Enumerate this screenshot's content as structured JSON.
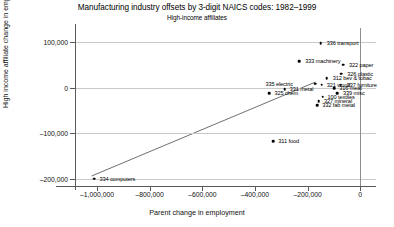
{
  "chart_data": {
    "type": "scatter",
    "title": "Manufacturing industry offsets by 3-digit NAICS codes: 1982–1999",
    "subtitle": "High-income affiliates",
    "xlabel": "Parent change in employment",
    "ylabel": "High income affiliate change in employment",
    "xlim": [
      -1080000,
      60000
    ],
    "ylim": [
      -215000,
      130000
    ],
    "xticks": [
      -1000000,
      -800000,
      -600000,
      -400000,
      -200000,
      0
    ],
    "xticklabels": [
      "–1,000,000",
      "–800,000",
      "–600,000",
      "–400,000",
      "–200,000",
      "0"
    ],
    "yticks": [
      100000,
      0,
      -100000,
      -200000
    ],
    "yticklabels": [
      "100,000",
      "0",
      "–100,000",
      "–200,000"
    ],
    "grid": true,
    "legend": "none",
    "marker_color": "#000000",
    "fit_line": {
      "x0": -1020000,
      "y0": -193000,
      "x1": -170000,
      "y1": 12000,
      "color": "#4a4a4a"
    },
    "points": [
      {
        "label": "336 transport",
        "x": -150000,
        "y": 97000,
        "lx": 6,
        "ly": 0
      },
      {
        "label": "333 machinery",
        "x": -232000,
        "y": 58000,
        "lx": 6,
        "ly": 0
      },
      {
        "label": "322 paper",
        "x": -65000,
        "y": 50000,
        "lx": 6,
        "ly": 0
      },
      {
        "label": "326 plastic",
        "x": -72000,
        "y": 30000,
        "lx": 6,
        "ly": 0
      },
      {
        "label": "312 bev & tobac",
        "x": -127000,
        "y": 21000,
        "lx": 6,
        "ly": 0
      },
      {
        "label": "337 furniture",
        "x": -74000,
        "y": 6000,
        "lx": 6,
        "ly": 0
      },
      {
        "label": "335 electric",
        "x": -170000,
        "y": 8000,
        "lx": -50,
        "ly": 0
      },
      {
        "label": "321 wood",
        "x": -146000,
        "y": 6000,
        "lx": 5,
        "ly": 0
      },
      {
        "label": "316 meat",
        "x": -99000,
        "y": -2000,
        "lx": 5,
        "ly": 0
      },
      {
        "label": "339 misc",
        "x": -88000,
        "y": -12000,
        "lx": 6,
        "ly": 0
      },
      {
        "label": "331 metal",
        "x": -287000,
        "y": -4000,
        "lx": 5,
        "ly": 0
      },
      {
        "label": "325 chem",
        "x": -345000,
        "y": -12000,
        "lx": 5,
        "ly": 0
      },
      {
        "label": "100 textiles",
        "x": -143000,
        "y": -20000,
        "lx": 5,
        "ly": 0
      },
      {
        "label": "327 mineral",
        "x": -157000,
        "y": -30000,
        "lx": 5,
        "ly": 0
      },
      {
        "label": "332 fab metal",
        "x": -163000,
        "y": -38000,
        "lx": 5,
        "ly": 0
      },
      {
        "label": "311 food",
        "x": -330000,
        "y": -117000,
        "lx": 5,
        "ly": 0
      },
      {
        "label": "334 computers",
        "x": -1010000,
        "y": -199000,
        "lx": 5,
        "ly": 0
      }
    ]
  }
}
